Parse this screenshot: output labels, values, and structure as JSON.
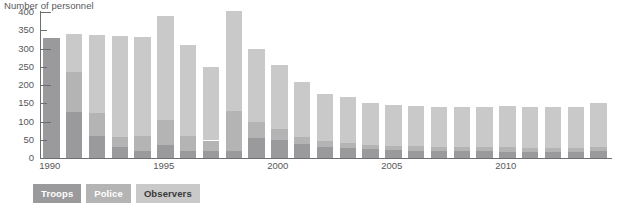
{
  "chart_data": {
    "type": "bar",
    "subtype": "stacked-bar",
    "title": "Number of personnel",
    "xlabel": "",
    "ylabel": "Number of personnel",
    "ylim": [
      0,
      400
    ],
    "ytick_step": 50,
    "ytick_labels": [
      "400",
      "350",
      "300",
      "250",
      "200",
      "150",
      "100",
      "50",
      "0"
    ],
    "ytick_values": [
      400,
      350,
      300,
      250,
      200,
      150,
      100,
      50,
      0
    ],
    "grid": false,
    "legend_position": "bottom-left",
    "categories": [
      "1990",
      "1991",
      "1992",
      "1993",
      "1994",
      "1995",
      "1996",
      "1997",
      "1998",
      "1999",
      "2000",
      "2001",
      "2002",
      "2003",
      "2004",
      "2005",
      "2006",
      "2007",
      "2008",
      "2009",
      "2010",
      "2011",
      "2012",
      "2013",
      "2014"
    ],
    "xtick_labels": [
      "1990",
      "1995",
      "2000",
      "2005",
      "2010"
    ],
    "xtick_categories": [
      "1990",
      "1995",
      "2000",
      "2005",
      "2010"
    ],
    "series": [
      {
        "name": "Troops",
        "color": "#9a9a9c",
        "values": [
          328,
          125,
          60,
          30,
          20,
          35,
          20,
          18,
          20,
          55,
          50,
          38,
          30,
          28,
          25,
          22,
          20,
          18,
          18,
          18,
          17,
          16,
          16,
          16,
          18
        ]
      },
      {
        "name": "Police",
        "color": "#b4b4b4",
        "values": [
          0,
          110,
          62,
          28,
          40,
          70,
          40,
          30,
          110,
          45,
          30,
          20,
          16,
          14,
          12,
          12,
          12,
          12,
          12,
          12,
          12,
          12,
          12,
          12,
          13
        ]
      },
      {
        "name": "Observers",
        "color": "#c9c9c9",
        "values": [
          0,
          105,
          215,
          275,
          272,
          285,
          250,
          202,
          272,
          198,
          175,
          150,
          130,
          125,
          113,
          110,
          110,
          110,
          110,
          110,
          113,
          113,
          113,
          113,
          119
        ]
      }
    ],
    "totals": [
      328,
      340,
      337,
      333,
      332,
      390,
      310,
      250,
      402,
      298,
      255,
      208,
      176,
      167,
      150,
      144,
      142,
      140,
      140,
      140,
      142,
      141,
      141,
      141,
      150
    ]
  },
  "legend": {
    "items": [
      {
        "label": "Troops",
        "color": "#9a9a9c",
        "text_color": "#ffffff"
      },
      {
        "label": "Police",
        "color": "#b4b4b4",
        "text_color": "#ffffff"
      },
      {
        "label": "Observers",
        "color": "#c9c9c9",
        "text_color": "#3a3a3a"
      }
    ]
  },
  "axis": {
    "line_color": "#6d6e70"
  },
  "footnote": {
    "text": ""
  }
}
